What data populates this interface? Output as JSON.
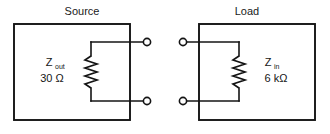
{
  "figure": {
    "type": "circuit-diagram",
    "stroke_color": "#141414",
    "background_color": "#ffffff"
  },
  "blocks": [
    {
      "id": "source",
      "title": "Source",
      "impedance_symbol": "Z",
      "impedance_subscript": "out",
      "impedance_value": "30 Ω",
      "component": "resistor",
      "terminal_count": 2
    },
    {
      "id": "load",
      "title": "Load",
      "impedance_symbol": "Z",
      "impedance_subscript": "in",
      "impedance_value": "6 kΩ",
      "component": "resistor",
      "terminal_count": 2
    }
  ],
  "terminals": {
    "source_top": "open-terminal",
    "source_bottom": "open-terminal",
    "load_top": "open-terminal",
    "load_bottom": "open-terminal"
  }
}
